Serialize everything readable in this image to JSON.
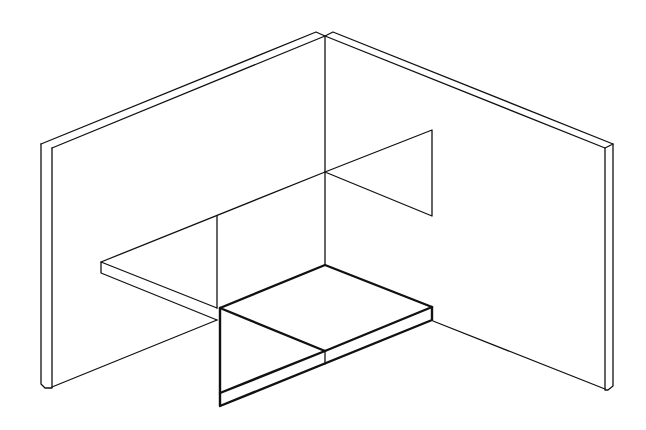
{
  "figure": {
    "type": "isometric line drawing",
    "stroke_color": "#111111",
    "background": "#ffffff"
  }
}
